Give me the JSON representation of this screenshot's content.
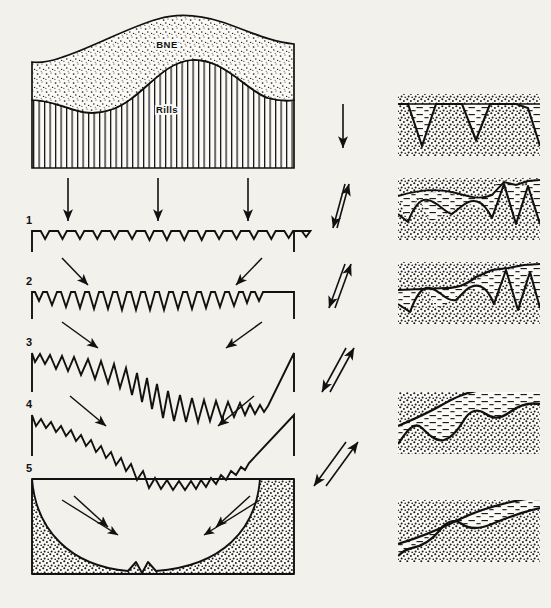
{
  "figure": {
    "background_color": "#f2f1ec",
    "ink_color": "#111111",
    "width": 551,
    "height": 608
  },
  "top_panel": {
    "name": "cross-section-block",
    "upper_unit_label": "BNE",
    "lower_unit_label": "Rills",
    "upper_unit_fill": "stipple",
    "lower_unit_fill": "vertical-hatch",
    "bounds": {
      "x": 30,
      "y": 12,
      "width": 265,
      "height": 160
    }
  },
  "transfer_arrows": {
    "name": "downward-transfer-arrows",
    "count": 3,
    "direction": "down",
    "x_positions": [
      68,
      158,
      248
    ],
    "y_top": 178,
    "y_bottom": 222
  },
  "stages": [
    {
      "number": "1",
      "label_x": 26,
      "label_y": 222,
      "box": {
        "x": 32,
        "y": 228,
        "width": 262,
        "height": 26
      },
      "teeth": 30,
      "tooth_depth": 9,
      "description": "shallow closely-spaced V-rills on planar surface"
    },
    {
      "number": "2",
      "label_x": 26,
      "label_y": 283,
      "box": {
        "x": 32,
        "y": 289,
        "width": 262,
        "height": 30
      },
      "teeth": 26,
      "tooth_depth": 16,
      "description": "rills deepen and widen, uniform depth"
    },
    {
      "number": "3",
      "label_x": 26,
      "label_y": 344,
      "box": {
        "x": 32,
        "y": 350,
        "width": 262,
        "height": 42
      },
      "teeth": 24,
      "tooth_depth": 22,
      "description": "rills deepen, central master rill begins to incise"
    },
    {
      "number": "4",
      "label_x": 26,
      "label_y": 406,
      "box": {
        "x": 32,
        "y": 412,
        "width": 262,
        "height": 44
      },
      "teeth": 26,
      "tooth_depth": 14,
      "description": "interfluves lowered, broad shallow central hollow"
    },
    {
      "number": "5",
      "label_x": 26,
      "label_y": 470,
      "box": {
        "x": 32,
        "y": 476,
        "width": 262,
        "height": 98
      },
      "teeth": 0,
      "tooth_depth": 0,
      "description": "coalesced U-shaped hollow with residual central notch, stippled fill"
    }
  ],
  "stage_link_arrows": {
    "name": "stage-link-arrows",
    "pairs": [
      {
        "from_stage": "1",
        "to_stage": "2",
        "left": {
          "x1": 66,
          "y1": 258,
          "x2": 86,
          "y2": 286
        },
        "right": {
          "x1": 258,
          "y1": 258,
          "x2": 238,
          "y2": 286
        }
      },
      {
        "from_stage": "2",
        "to_stage": "3",
        "left": {
          "x1": 66,
          "y1": 322,
          "x2": 96,
          "y2": 347
        },
        "right": {
          "x1": 258,
          "y1": 322,
          "x2": 226,
          "y2": 347
        }
      },
      {
        "from_stage": "3",
        "to_stage": "4",
        "left": {
          "x1": 72,
          "y1": 396,
          "x2": 104,
          "y2": 424
        },
        "right": {
          "x1": 252,
          "y1": 396,
          "x2": 220,
          "y2": 424
        }
      },
      {
        "from_stage": "4",
        "to_stage": "5",
        "left": {
          "x1": 76,
          "y1": 494,
          "x2": 106,
          "y2": 524
        },
        "right": {
          "x1": 248,
          "y1": 494,
          "x2": 218,
          "y2": 524
        }
      }
    ]
  },
  "middle_arrows": {
    "name": "process-vector-arrows",
    "description": "single vertical arrow followed by four arrow pairs of increasing obliquity",
    "groups": [
      {
        "index": 1,
        "type": "single-vertical",
        "cx": 343,
        "y1": 104,
        "y2": 148
      },
      {
        "index": 2,
        "type": "pair",
        "cx": 343,
        "y1": 182,
        "y2": 226,
        "tilt": 8
      },
      {
        "index": 3,
        "type": "pair",
        "cx": 343,
        "y1": 262,
        "y2": 306,
        "tilt": 14
      },
      {
        "index": 4,
        "type": "pair",
        "cx": 343,
        "y1": 346,
        "y2": 390,
        "tilt": 22
      },
      {
        "index": 5,
        "type": "pair",
        "cx": 343,
        "y1": 440,
        "y2": 484,
        "tilt": 32
      }
    ]
  },
  "right_panels": [
    {
      "index": 1,
      "name": "rill-infill-panel-1",
      "box": {
        "x": 398,
        "y": 94,
        "width": 142,
        "height": 62
      },
      "ground_fill": "stipple",
      "infill_fill": "dash-hatch",
      "surface": "flat",
      "notches": 3,
      "description": "sharp V-rills in stippled substrate, partly filled with blanket sediment"
    },
    {
      "index": 2,
      "name": "rill-infill-panel-2",
      "box": {
        "x": 398,
        "y": 178,
        "width": 142,
        "height": 62
      },
      "ground_fill": "stipple",
      "infill_fill": "dash-hatch",
      "surface": "gently-undulating",
      "notches": 3,
      "description": "left rills buried and rounded, right rills still open"
    },
    {
      "index": 3,
      "name": "rill-infill-panel-3",
      "box": {
        "x": 398,
        "y": 262,
        "width": 142,
        "height": 62
      },
      "ground_fill": "stipple",
      "infill_fill": "dash-hatch",
      "surface": "stepped-inclined",
      "notches": 3,
      "description": "blanket thickens to the left, burying rills; slope steepens right"
    },
    {
      "index": 4,
      "name": "rill-infill-panel-4",
      "box": {
        "x": 398,
        "y": 392,
        "width": 142,
        "height": 62
      },
      "ground_fill": "stipple",
      "infill_fill": "dash-hatch",
      "surface": "rounded-inclined",
      "notches": 3,
      "description": "rills smoothed into rounded mounds beneath continuous blanket"
    },
    {
      "index": 5,
      "name": "rill-infill-panel-5",
      "box": {
        "x": 398,
        "y": 500,
        "width": 142,
        "height": 62
      },
      "ground_fill": "stipple",
      "infill_fill": "dash-hatch",
      "surface": "smooth-inclined",
      "notches": 2,
      "description": "near-planar inclined surface with thin residual blanket"
    }
  ]
}
